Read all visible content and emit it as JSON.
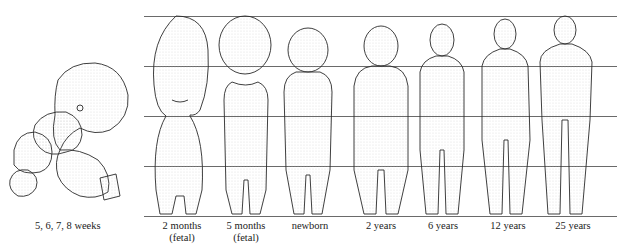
{
  "diagram": {
    "embryo_group": {
      "label": "5, 6, 7, 8 weeks"
    },
    "figures": [
      {
        "id": "2-months",
        "label_line1": "2 months",
        "label_line2": "(fetal)"
      },
      {
        "id": "5-months",
        "label_line1": "5 months",
        "label_line2": "(fetal)"
      },
      {
        "id": "newborn",
        "label_line1": "newborn",
        "label_line2": ""
      },
      {
        "id": "2-years",
        "label_line1": "2 years",
        "label_line2": ""
      },
      {
        "id": "6-years",
        "label_line1": "6 years",
        "label_line2": ""
      },
      {
        "id": "12-years",
        "label_line1": "12 years",
        "label_line2": ""
      },
      {
        "id": "25-years",
        "label_line1": "25 years",
        "label_line2": ""
      }
    ],
    "guide_lines_count": 5,
    "line_color": "#6a6a6a",
    "stroke_color": "#2a2a2a"
  }
}
